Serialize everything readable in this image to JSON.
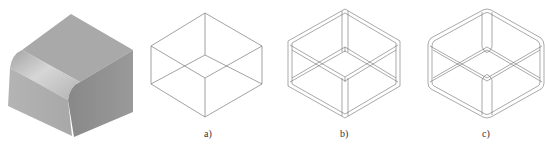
{
  "figure": {
    "panels": [
      {
        "id": "solid",
        "label": "",
        "description": "shaded solid block with one rounded (filleted) edge"
      },
      {
        "id": "a",
        "label": "a)",
        "description": "wireframe box"
      },
      {
        "id": "b",
        "label": "b)",
        "description": "wireframe box with edge offsets"
      },
      {
        "id": "c",
        "label": "c)",
        "description": "wireframe box with filleted edges"
      }
    ],
    "colors": {
      "line": "#6f6f6f",
      "solid_top": "#a9a9a9",
      "solid_left": "#b7b7b7",
      "solid_right": "#8c8c8c",
      "fillet_highlight": "#d4d4d4"
    }
  }
}
